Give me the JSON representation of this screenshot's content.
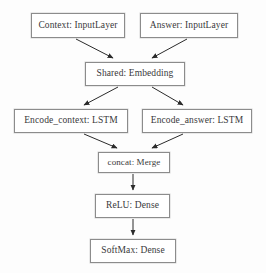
{
  "diagram": {
    "type": "flowchart",
    "background_color": "#fdfdfd",
    "node_border_color": "#8c8c8c",
    "node_fill_color": "#ffffff",
    "text_color": "#39393b",
    "edge_color": "#2b2b2b",
    "nodes": [
      {
        "id": "context",
        "label": "Context: InputLayer",
        "name": "Context",
        "layer_type": "InputLayer"
      },
      {
        "id": "answer",
        "label": "Answer: InputLayer",
        "name": "Answer",
        "layer_type": "InputLayer"
      },
      {
        "id": "shared",
        "label": "Shared: Embedding",
        "name": "Shared",
        "layer_type": "Embedding"
      },
      {
        "id": "enc_ctx",
        "label": "Encode_context: LSTM",
        "name": "Encode_context",
        "layer_type": "LSTM"
      },
      {
        "id": "enc_ans",
        "label": "Encode_answer: LSTM",
        "name": "Encode_answer",
        "layer_type": "LSTM"
      },
      {
        "id": "concat",
        "label": "concat: Merge",
        "name": "concat",
        "layer_type": "Merge"
      },
      {
        "id": "relu",
        "label": "ReLU: Dense",
        "name": "ReLU",
        "layer_type": "Dense"
      },
      {
        "id": "softmax",
        "label": "SoftMax: Dense",
        "name": "SoftMax",
        "layer_type": "Dense"
      }
    ],
    "edges": [
      {
        "from": "context",
        "to": "shared"
      },
      {
        "from": "answer",
        "to": "shared"
      },
      {
        "from": "shared",
        "to": "enc_ctx"
      },
      {
        "from": "shared",
        "to": "enc_ans"
      },
      {
        "from": "enc_ctx",
        "to": "concat"
      },
      {
        "from": "enc_ans",
        "to": "concat"
      },
      {
        "from": "concat",
        "to": "relu"
      },
      {
        "from": "relu",
        "to": "softmax"
      }
    ]
  }
}
